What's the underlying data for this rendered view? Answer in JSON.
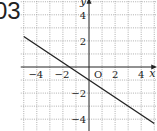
{
  "problem_label": "03",
  "chart_data": {
    "type": "line",
    "title": "",
    "xlabel": "x",
    "ylabel": "y",
    "origin_label": "O",
    "xlim": [
      -5,
      5
    ],
    "ylim": [
      -5,
      5
    ],
    "grid": true,
    "x_ticks": [
      -4,
      -2,
      2,
      4
    ],
    "y_ticks": [
      4,
      2,
      -2,
      -4
    ],
    "x_tick_labels": [
      "−4",
      "−2",
      "2",
      "4"
    ],
    "y_tick_labels": [
      "4",
      "2",
      "−2",
      "−4"
    ],
    "series": [
      {
        "name": "line",
        "equation": "y = -2/3 x - 1",
        "x": [
          -5,
          5
        ],
        "y": [
          2.333,
          -4.333
        ]
      }
    ],
    "colors": {
      "line": "#222222",
      "grid": "#9a9a9a",
      "axis": "#222222"
    }
  }
}
